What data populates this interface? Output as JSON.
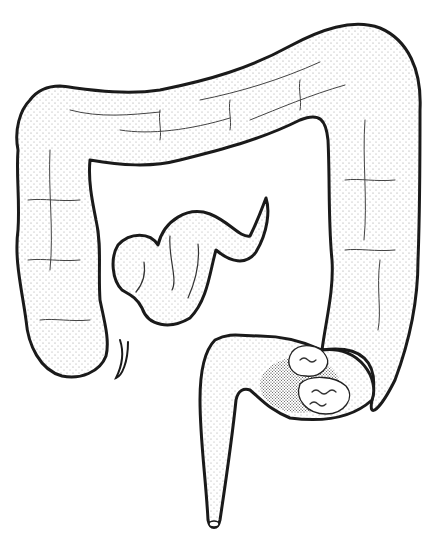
{
  "image": {
    "subject": "Line illustration of the large intestine (colon) with small intestine loops and a tumor mass at the sigmoid region",
    "style": "black ink stipple drawing on white background",
    "colors": {
      "background": "#ffffff",
      "ink": "#1a1a1a"
    },
    "parts": [
      "ascending colon",
      "transverse colon",
      "descending colon",
      "sigmoid colon with mass",
      "rectum",
      "small intestine loops",
      "appendix"
    ]
  }
}
